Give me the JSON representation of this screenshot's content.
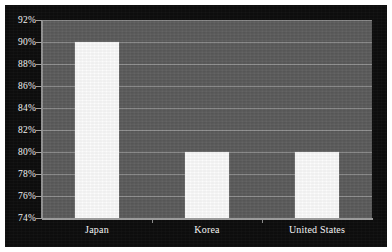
{
  "chart_data": {
    "type": "bar",
    "title": "",
    "subtitle": "",
    "xlabel": "",
    "ylabel": "",
    "categories": [
      "Japan",
      "Korea",
      "United States"
    ],
    "values": [
      90,
      80,
      80
    ],
    "value_suffix": "%",
    "ylim": [
      74,
      92
    ],
    "ytick_step": 2,
    "ytick_labels": [
      "92%",
      "90%",
      "88%",
      "86%",
      "84%",
      "82%",
      "80%",
      "78%",
      "76%",
      "74%"
    ],
    "ytick_values": [
      92,
      90,
      88,
      86,
      84,
      82,
      80,
      78,
      76,
      74
    ],
    "grid": true,
    "grid_axis": "y",
    "legend": false,
    "legend_position": "none",
    "series": [
      {
        "name": "",
        "values": [
          90,
          80,
          80
        ]
      }
    ]
  },
  "style": {
    "page_background": "#ffffff",
    "panel_background": "#0d0d0d",
    "plot_background": "#5b5b5b",
    "gridline_color": "#8e8e8e",
    "bar_color": "#fcfcfc",
    "axis_color": "#9a9a9a",
    "text_color": "#f2f2f2"
  },
  "axis": {
    "y_labels": [
      {
        "text": "92%",
        "value": 92
      },
      {
        "text": "90%",
        "value": 90
      },
      {
        "text": "88%",
        "value": 88
      },
      {
        "text": "86%",
        "value": 86
      },
      {
        "text": "84%",
        "value": 84
      },
      {
        "text": "82%",
        "value": 82
      },
      {
        "text": "80%",
        "value": 80
      },
      {
        "text": "78%",
        "value": 78
      },
      {
        "text": "76%",
        "value": 76
      },
      {
        "text": "74%",
        "value": 74
      }
    ],
    "x_labels": [
      {
        "text": "Japan"
      },
      {
        "text": "Korea"
      },
      {
        "text": "United States"
      }
    ]
  }
}
